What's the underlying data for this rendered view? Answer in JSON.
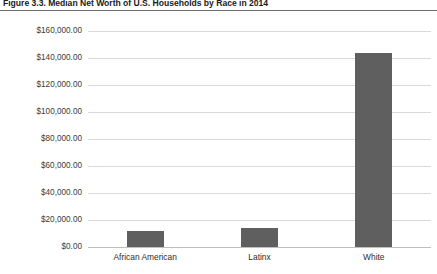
{
  "figure": {
    "title": "Figure 3.3. Median Net Worth of U.S. Households by Race in 2014"
  },
  "chart_data": {
    "type": "bar",
    "title": "Figure 3.3. Median Net Worth of U.S. Households by Race in 2014",
    "xlabel": "",
    "ylabel": "",
    "categories": [
      "African American",
      "Latinx",
      "White"
    ],
    "values": [
      11900,
      14100,
      143600
    ],
    "value_labels": [
      "$11,900.00",
      "$14,100.00",
      "$143,600.00"
    ],
    "ylim": [
      0,
      160000
    ],
    "ytick_values": [
      0,
      20000,
      40000,
      60000,
      80000,
      100000,
      120000,
      140000,
      160000
    ],
    "ytick_labels": [
      "$0.00",
      "$20,000.00",
      "$40,000.00",
      "$60,000.00",
      "$80,000.00",
      "$100,000.00",
      "$120,000.00",
      "$140,000.00",
      "$160,000.00"
    ],
    "grid": true,
    "legend": false,
    "legend_position": "none",
    "bar_color": "#5f5f5f",
    "gridline_color": "#d9d9d9",
    "background_color": "#ffffff"
  }
}
